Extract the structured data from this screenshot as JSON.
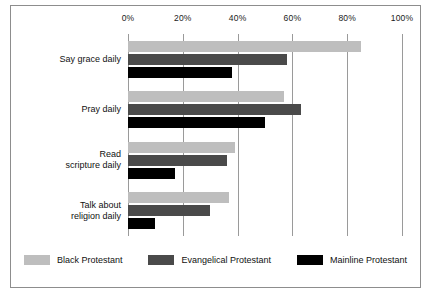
{
  "chart_data": {
    "type": "bar",
    "orientation": "horizontal",
    "title": "",
    "xlabel": "",
    "ylabel": "",
    "xlim": [
      0,
      100
    ],
    "grid": true,
    "legend_position": "bottom",
    "categories": [
      "Say grace daily",
      "Pray daily",
      "Read scripture daily",
      "Talk about religion daily"
    ],
    "category_lines": [
      [
        "Say grace daily"
      ],
      [
        "Pray daily"
      ],
      [
        "Read",
        "scripture daily"
      ],
      [
        "Talk about",
        "religion daily"
      ]
    ],
    "tick_labels": [
      "0%",
      "20%",
      "40%",
      "60%",
      "80%",
      "100%"
    ],
    "tick_values": [
      0,
      20,
      40,
      60,
      80,
      100
    ],
    "series": [
      {
        "name": "Black Protestant",
        "color": "#bebebe",
        "values": [
          85,
          57,
          39,
          37
        ]
      },
      {
        "name": "Evangelical Protestant",
        "color": "#4a4a4a",
        "values": [
          58,
          63,
          36,
          30
        ]
      },
      {
        "name": "Mainline Protestant",
        "color": "#000000",
        "values": [
          38,
          50,
          17,
          10
        ]
      }
    ]
  },
  "legend": {
    "items": [
      {
        "label": "Black Protestant",
        "color": "#bebebe"
      },
      {
        "label": "Evangelical Protestant",
        "color": "#4a4a4a"
      },
      {
        "label": "Mainline Protestant",
        "color": "#000000"
      }
    ]
  },
  "frame": {
    "border_color": "#8d8d8d",
    "background": "#ffffff"
  }
}
